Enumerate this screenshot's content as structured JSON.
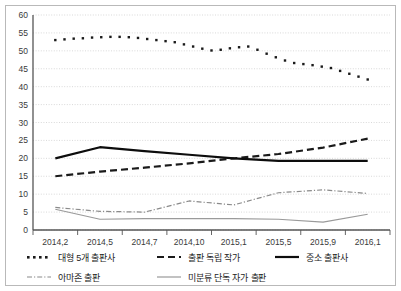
{
  "chart_data": {
    "type": "line",
    "title": "",
    "subtitle": "",
    "xlabel": "",
    "ylabel": "",
    "ylim": [
      0,
      60
    ],
    "ytick_step": 5,
    "yticks": [
      0,
      5,
      10,
      15,
      20,
      25,
      30,
      35,
      40,
      45,
      50,
      55,
      60
    ],
    "grid": true,
    "grid_axis": "y",
    "legend_position": "bottom",
    "categories": [
      "2014,2",
      "2014,5",
      "2014,7",
      "2014,10",
      "2015,1",
      "2015,5",
      "2015,9",
      "2016,1"
    ],
    "x": [
      0,
      1,
      2,
      3,
      4,
      5,
      6,
      7
    ],
    "series": [
      {
        "name": "대형 5개 출판사",
        "style": "dotted",
        "color": "#1a1a1a",
        "values": [
          53.0,
          53.9,
          52.4,
          50.1,
          51.2,
          46.6,
          45.2,
          42.0
        ],
        "dense_points": [
          53.0,
          53.2,
          53.4,
          53.5,
          53.7,
          53.8,
          53.9,
          53.9,
          53.8,
          53.6,
          53.3,
          53.0,
          52.7,
          52.4,
          51.8,
          51.2,
          50.6,
          50.1,
          50.3,
          50.7,
          51.0,
          51.2,
          50.3,
          49.2,
          48.2,
          47.3,
          46.6,
          46.3,
          46.0,
          45.6,
          45.2,
          44.4,
          43.6,
          42.8,
          42.0
        ]
      },
      {
        "name": "출판 독립 작가",
        "style": "dashed",
        "color": "#1a1a1a",
        "values": [
          15.0,
          16.3,
          17.4,
          18.6,
          20.0,
          21.2,
          23.0,
          25.5
        ]
      },
      {
        "name": "중소 출판사",
        "style": "solid",
        "color": "#0d0d0d",
        "values": [
          20.0,
          23.1,
          22.0,
          21.0,
          20.0,
          19.3,
          19.3,
          19.3
        ]
      },
      {
        "name": "아마존 출판",
        "style": "dash-dot",
        "color": "#8a8a8a",
        "values": [
          6.3,
          5.2,
          5.0,
          8.1,
          7.0,
          10.4,
          11.2,
          10.2
        ]
      },
      {
        "name": "미분류 단독 자가 출판",
        "style": "solid-thin",
        "color": "#9a9a9a",
        "values": [
          5.8,
          3.0,
          3.2,
          3.2,
          3.2,
          3.0,
          2.2,
          4.4
        ]
      }
    ],
    "legend": [
      {
        "label": "대형 5개 출판사",
        "style": "dotted",
        "color": "#1a1a1a"
      },
      {
        "label": "출판 독립 작가",
        "style": "dashed",
        "color": "#1a1a1a"
      },
      {
        "label": "중소 출판사",
        "style": "solid",
        "color": "#0d0d0d"
      },
      {
        "label": "아마존 출판",
        "style": "dash-dot",
        "color": "#8a8a8a"
      },
      {
        "label": "미분류 단독 자가 출판",
        "style": "solid-thin",
        "color": "#9a9a9a"
      }
    ]
  },
  "axis": {
    "y_labels": [
      "60",
      "55",
      "50",
      "45",
      "40",
      "35",
      "30",
      "25",
      "20",
      "15",
      "10",
      "5",
      "0"
    ],
    "x_labels": [
      "2014,2",
      "2014,5",
      "2014,7",
      "2014,10",
      "2015,1",
      "2015,5",
      "2015,9",
      "2016,1"
    ]
  },
  "colors": {
    "frame": "#b9b9b9",
    "grid": "#c8c8c8",
    "axis": "#555555",
    "text": "#2b2b2b"
  }
}
